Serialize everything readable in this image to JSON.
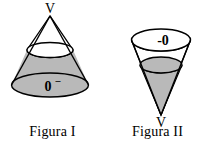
{
  "diagram": {
    "background_color": "#ffffff",
    "stroke_color": "#000000",
    "shade_color": "#b9b9b9",
    "figures": [
      {
        "id": "figure-one",
        "caption": "Figura I",
        "orientation": "apex-up",
        "vertex_label": "V",
        "base_label": "0",
        "base_label_superscript": "–",
        "shaded_part": "lower-frustum",
        "unshaded_part": "upper-cone"
      },
      {
        "id": "figure-two",
        "caption": "Figura II",
        "orientation": "apex-down",
        "vertex_label": "V",
        "top_label": "-0",
        "shaded_part": "lower-inner-cone",
        "unshaded_part": "upper-frustum"
      }
    ]
  }
}
